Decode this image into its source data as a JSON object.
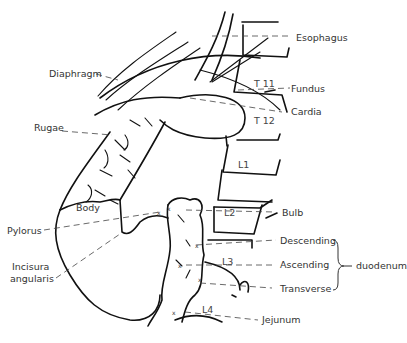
{
  "diagram": {
    "labels_left": {
      "diaphragm": "Diaphragm",
      "rugae": "Rugae",
      "body": "Body",
      "pylorus": "Pylorus",
      "incisura_line1": "Incisura",
      "incisura_line2": "angularis"
    },
    "labels_right": {
      "esophagus": "Esophagus",
      "fundus": "Fundus",
      "cardia": "Cardia",
      "bulb": "Bulb",
      "descending": "Descending",
      "ascending": "Ascending",
      "transverse": "Transverse",
      "duodenum": "duodenum",
      "jejunum": "Jejunum"
    },
    "vertebrae": {
      "t11": "T 11",
      "t12": "T 12",
      "l1": "L1",
      "l2": "L2",
      "l3": "L3",
      "l4": "L4"
    }
  }
}
